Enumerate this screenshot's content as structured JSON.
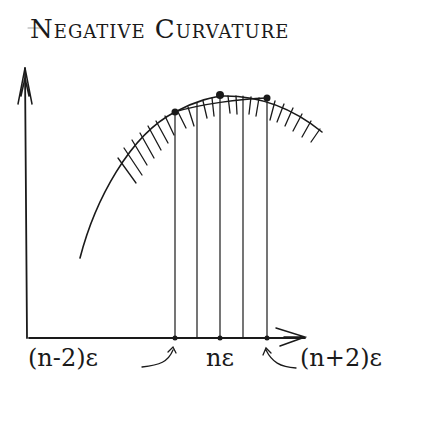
{
  "title": "Negative Curvature",
  "labels": {
    "left": "(n-2)ε",
    "middle": "nε",
    "right": "(n+2)ε"
  },
  "colors": {
    "ink": "#1a1a1a",
    "background": "#ffffff"
  },
  "diagram": {
    "axes": {
      "origin": [
        29,
        338
      ],
      "y_top": [
        25,
        67
      ],
      "x_end": [
        305,
        338
      ]
    },
    "curve": "concave-down arc with hatching beneath",
    "verticals_x": [
      175,
      197,
      220,
      243,
      267
    ],
    "points": [
      [
        175,
        112
      ],
      [
        220,
        95
      ],
      [
        267,
        98
      ]
    ],
    "chord": "secant connecting (n-2)ε and (n+2)ε points"
  }
}
